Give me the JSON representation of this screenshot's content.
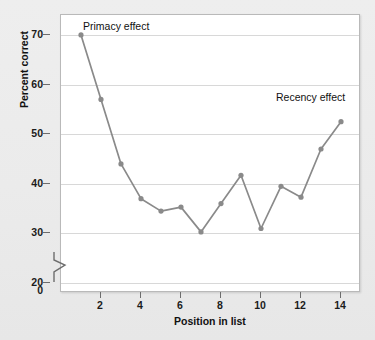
{
  "figure": {
    "background_color": "#ececec",
    "plot_background_color": "#ffffff",
    "series_color": "#8a8a8a",
    "grid_color": "#d8d8d8",
    "axis_color": "#6d6d6d"
  },
  "chart_data": {
    "type": "line",
    "title": "",
    "xlabel": "Position in list",
    "ylabel": "Percent correct",
    "xlim": [
      0,
      15
    ],
    "ylim": [
      18,
      74
    ],
    "grid": true,
    "legend": "none",
    "y_axis_break": true,
    "y_axis_break_symbol": "zigzag",
    "xticks": [
      0,
      2,
      4,
      6,
      8,
      10,
      12,
      14
    ],
    "xticklabels": [
      "0",
      "2",
      "4",
      "6",
      "8",
      "10",
      "12",
      "14"
    ],
    "yticks": [
      20,
      30,
      40,
      50,
      60,
      70
    ],
    "yticklabels": [
      "20",
      "30",
      "40",
      "50",
      "60",
      "70"
    ],
    "x": [
      1,
      2,
      3,
      4,
      5,
      6,
      7,
      8,
      9,
      10,
      11,
      12,
      13,
      14
    ],
    "values": [
      70.0,
      57.0,
      44.0,
      37.0,
      34.5,
      35.3,
      30.3,
      36.0,
      41.7,
      31.0,
      39.5,
      37.3,
      47.0,
      52.5
    ],
    "series": [
      {
        "name": "Percent correct by serial position",
        "values": [
          70.0,
          57.0,
          44.0,
          37.0,
          34.5,
          35.3,
          30.3,
          36.0,
          41.7,
          31.0,
          39.5,
          37.3,
          47.0,
          52.5
        ]
      }
    ],
    "annotations": [
      {
        "text": "Primacy effect",
        "x": 1,
        "y": 73
      },
      {
        "text": "Recency effect",
        "x": 12.5,
        "y": 55
      }
    ]
  }
}
